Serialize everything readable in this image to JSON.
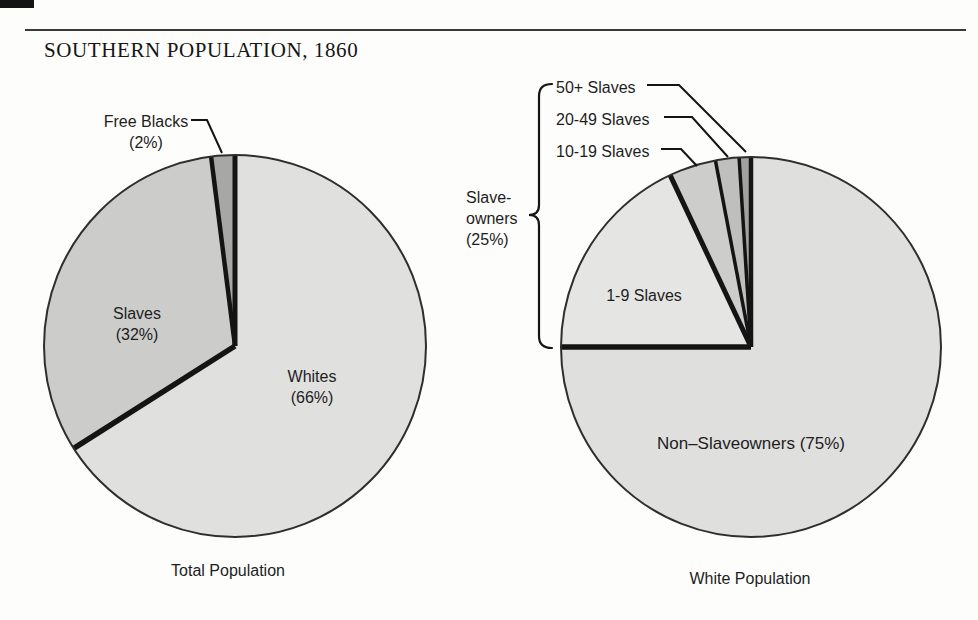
{
  "page": {
    "title": "SOUTHERN POPULATION, 1860"
  },
  "figure": {
    "left_caption": "Total Population",
    "right_caption": "White Population"
  },
  "labels": {
    "free_blacks": "Free Blacks\n(2%)",
    "slaves": "Slaves\n(32%)",
    "whites": "Whites\n(66%)",
    "slave_owners": "Slave-\nowners\n(25%)",
    "fifty_plus": "50+ Slaves",
    "twenty_49": "20-49 Slaves",
    "ten_19": "10-19 Slaves",
    "one_9": "1-9 Slaves",
    "non_slaveowners": "Non–Slaveowners (75%)"
  },
  "colors": {
    "line": "#141414",
    "outline": "#2e2e2e"
  },
  "chart_data": [
    {
      "type": "pie",
      "title": "Total Population",
      "start_angle_deg": 0,
      "direction": "clockwise",
      "slices": [
        {
          "label": "Whites",
          "value": 66,
          "color": "#e0e0df",
          "edge": 5
        },
        {
          "label": "Slaves",
          "value": 32,
          "color": "#cccccb",
          "edge": 5.5
        },
        {
          "label": "Free Blacks",
          "value": 2,
          "color": "#a7a7a6",
          "edge": 4.5
        }
      ]
    },
    {
      "type": "pie",
      "title": "White Population",
      "start_angle_deg": 0,
      "direction": "clockwise",
      "group_note": "Slave-owners (25%) = 1-9, 10-19, 20-49 and 50+ Slaves slices",
      "slices": [
        {
          "label": "Non-Slaveowners (75%)",
          "value": 75,
          "color": "#dfdfde",
          "edge": 4.5
        },
        {
          "label": "1-9 Slaves",
          "value": 18,
          "color": "#e5e5e4",
          "edge": 5.5
        },
        {
          "label": "10-19 Slaves",
          "value": 4,
          "color": "#cdcdcc",
          "edge": 5
        },
        {
          "label": "20-49 Slaves",
          "value": 2,
          "color": "#bfbfbe",
          "edge": 3.5
        },
        {
          "label": "50+ Slaves",
          "value": 1,
          "color": "#a2a2a1",
          "edge": 3.5
        }
      ]
    }
  ]
}
